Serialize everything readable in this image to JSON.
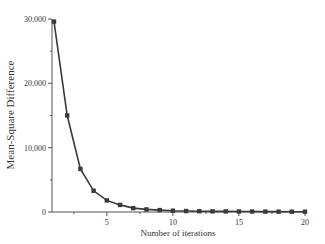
{
  "chart_data": {
    "type": "line",
    "title": "",
    "xlabel": "Number of iterations",
    "ylabel": "Mean-Square Difference",
    "x": [
      1,
      2,
      3,
      4,
      5,
      6,
      7,
      8,
      9,
      10,
      11,
      12,
      13,
      14,
      15,
      16,
      17,
      18,
      19,
      20
    ],
    "series": [
      {
        "name": "Mean-Square Difference",
        "marker": "square",
        "color": "#3a3a3a",
        "values": [
          29600,
          15000,
          6700,
          3300,
          1800,
          1100,
          600,
          400,
          300,
          200,
          150,
          120,
          100,
          90,
          80,
          70,
          60,
          55,
          50,
          50
        ]
      }
    ],
    "xlim": [
      0.85,
      20
    ],
    "ylim": [
      0,
      30000
    ],
    "xticks": [
      5,
      10,
      15,
      20
    ],
    "xtick_labels": [
      "5",
      "10",
      "15",
      "20"
    ],
    "yticks": [
      0,
      10000,
      20000,
      30000
    ],
    "ytick_labels": [
      "0",
      "10,000",
      "20,000",
      "30,000"
    ],
    "grid": false,
    "legend": "none"
  }
}
